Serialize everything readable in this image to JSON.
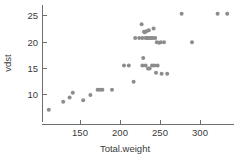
{
  "chart_data": {
    "type": "scatter",
    "title": "",
    "xlabel": "Total.weight",
    "ylabel": "vdst",
    "xlim": [
      105,
      340
    ],
    "ylim": [
      6,
      26.5
    ],
    "xticks": [
      150,
      200,
      250,
      300
    ],
    "yticks": [
      10,
      15,
      20,
      25
    ],
    "xtick_labels": [
      "150",
      "200",
      "250",
      "300"
    ],
    "ytick_labels": [
      "10",
      "15",
      "20",
      "25"
    ],
    "grid": false,
    "legend": false,
    "point_color": "#8c8c8c",
    "point_radius": 2.0,
    "axis_color": "#6e6e6e",
    "text_color": "#3a3a3a",
    "points": [
      {
        "x": 111,
        "y": 7.2
      },
      {
        "x": 129,
        "y": 8.7
      },
      {
        "x": 137,
        "y": 9.5
      },
      {
        "x": 141,
        "y": 10.4
      },
      {
        "x": 154,
        "y": 9.0
      },
      {
        "x": 163,
        "y": 10.0
      },
      {
        "x": 172,
        "y": 11.0
      },
      {
        "x": 175,
        "y": 11.0
      },
      {
        "x": 178,
        "y": 11.0
      },
      {
        "x": 190,
        "y": 11.0
      },
      {
        "x": 205,
        "y": 15.6
      },
      {
        "x": 211,
        "y": 15.6
      },
      {
        "x": 217,
        "y": 12.5
      },
      {
        "x": 219,
        "y": 20.8
      },
      {
        "x": 224,
        "y": 20.8
      },
      {
        "x": 227,
        "y": 23.4
      },
      {
        "x": 228,
        "y": 20.8
      },
      {
        "x": 230,
        "y": 22.0
      },
      {
        "x": 231,
        "y": 21.9
      },
      {
        "x": 232,
        "y": 20.8
      },
      {
        "x": 233,
        "y": 22.1
      },
      {
        "x": 234,
        "y": 20.8
      },
      {
        "x": 235,
        "y": 20.8
      },
      {
        "x": 236,
        "y": 22.3
      },
      {
        "x": 237,
        "y": 20.8
      },
      {
        "x": 239,
        "y": 20.8
      },
      {
        "x": 241,
        "y": 20.8
      },
      {
        "x": 242,
        "y": 22.6
      },
      {
        "x": 244,
        "y": 20.8
      },
      {
        "x": 246,
        "y": 20.0
      },
      {
        "x": 249,
        "y": 19.9
      },
      {
        "x": 251,
        "y": 20.0
      },
      {
        "x": 255,
        "y": 20.0
      },
      {
        "x": 229,
        "y": 17.0
      },
      {
        "x": 228,
        "y": 15.6
      },
      {
        "x": 232,
        "y": 15.6
      },
      {
        "x": 235,
        "y": 15.0
      },
      {
        "x": 237,
        "y": 15.0
      },
      {
        "x": 240,
        "y": 15.6
      },
      {
        "x": 243,
        "y": 15.6
      },
      {
        "x": 247,
        "y": 15.6
      },
      {
        "x": 245,
        "y": 14.2
      },
      {
        "x": 252,
        "y": 14.0
      },
      {
        "x": 259,
        "y": 14.0
      },
      {
        "x": 277,
        "y": 25.4
      },
      {
        "x": 290,
        "y": 20.0
      },
      {
        "x": 322,
        "y": 25.4
      },
      {
        "x": 334,
        "y": 25.4
      }
    ]
  }
}
